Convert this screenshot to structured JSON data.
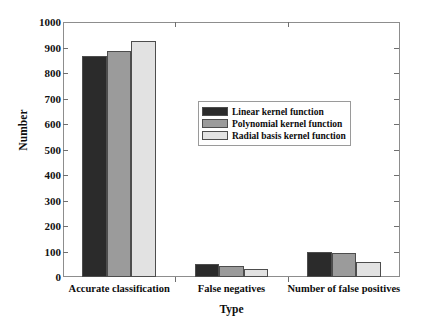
{
  "chart_data": {
    "type": "bar",
    "title": "",
    "xlabel": "Type",
    "ylabel": "Number",
    "categories": [
      "Accurate classification",
      "False negatives",
      "Number of false positives"
    ],
    "series": [
      {
        "name": "Linear kernel function",
        "color": "#2b2b2b",
        "values": [
          865,
          50,
          100
        ]
      },
      {
        "name": "Polynomial kernel function",
        "color": "#9b9b9b",
        "values": [
          885,
          42,
          93
        ]
      },
      {
        "name": "Radial basis kernel function",
        "color": "#e2e2e2",
        "values": [
          925,
          32,
          60
        ]
      }
    ],
    "ylim": [
      0,
      1000
    ],
    "yticks": [
      0,
      100,
      200,
      300,
      400,
      500,
      600,
      700,
      800,
      900,
      1000
    ],
    "ytick_labels": [
      "0",
      "100",
      "200",
      "300",
      "400",
      "500",
      "600",
      "700",
      "800",
      "900",
      "1000"
    ],
    "grid": false,
    "legend_position": "center"
  },
  "axes": {
    "y_title": "Number",
    "x_title": "Type"
  },
  "legend": {
    "entries": [
      {
        "label": "Linear kernel function",
        "color": "#2b2b2b"
      },
      {
        "label": "Polynomial kernel function",
        "color": "#9b9b9b"
      },
      {
        "label": "Radial basis kernel function",
        "color": "#e2e2e2"
      }
    ]
  }
}
